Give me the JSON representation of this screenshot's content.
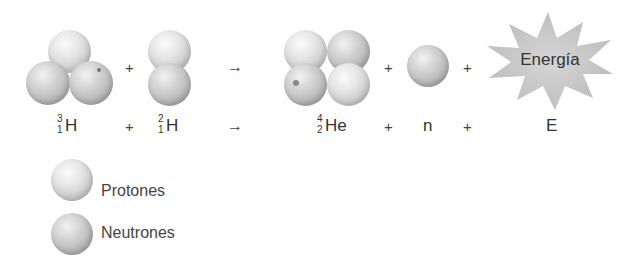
{
  "equation": {
    "reactants": [
      {
        "symbol": "H",
        "mass_number": "3",
        "atomic_number": "1",
        "name": "tritium",
        "protons": 1,
        "neutrons": 2
      },
      {
        "symbol": "H",
        "mass_number": "2",
        "atomic_number": "1",
        "name": "deuterium",
        "protons": 1,
        "neutrons": 1
      }
    ],
    "products": [
      {
        "symbol": "He",
        "mass_number": "4",
        "atomic_number": "2",
        "protons": 2,
        "neutrons": 2
      },
      {
        "symbol": "n"
      },
      {
        "symbol": "E"
      }
    ],
    "plus": "+",
    "arrow": "→"
  },
  "energy_burst": {
    "label": "Energía"
  },
  "legend": {
    "items": [
      {
        "label": "Protones"
      },
      {
        "label": "Neutrones"
      }
    ]
  }
}
